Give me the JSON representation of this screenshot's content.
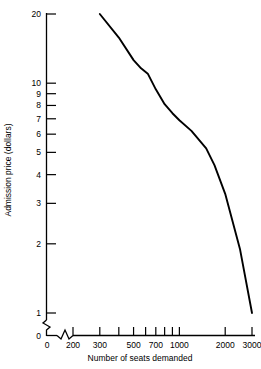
{
  "chart_data": {
    "type": "line",
    "title": "",
    "xlabel": "Number of seats demanded",
    "ylabel": "Admission price (dollars)",
    "x_scale": "log",
    "y_scale": "log",
    "xlim": [
      200,
      3000
    ],
    "ylim": [
      1,
      20
    ],
    "grid": false,
    "legend": null,
    "axis_break": {
      "x": true,
      "y": true,
      "note": "zigzag break between 0 and first log tick on both axes"
    },
    "x_origin_label": "0",
    "y_origin_label": "0",
    "xticks": [
      200,
      300,
      400,
      500,
      600,
      700,
      800,
      900,
      1000,
      2000,
      3000
    ],
    "xticklabels": [
      "200",
      "300",
      "",
      "500",
      "",
      "700",
      "",
      "",
      "1000",
      "2000",
      "3000"
    ],
    "yticks": [
      1,
      2,
      3,
      4,
      5,
      6,
      7,
      8,
      9,
      10,
      20
    ],
    "yticklabels": [
      "1",
      "2",
      "3",
      "4",
      "5",
      "6",
      "7",
      "8",
      "9",
      "10",
      "20"
    ],
    "series": [
      {
        "name": "Demand curve",
        "color": "#000000",
        "x": [
          300,
          400,
          500,
          560,
          620,
          700,
          800,
          900,
          1000,
          1200,
          1500,
          1700,
          2000,
          2500,
          3000
        ],
        "y": [
          20.0,
          15.8,
          12.6,
          11.6,
          11.0,
          9.4,
          8.1,
          7.4,
          6.9,
          6.2,
          5.2,
          4.4,
          3.3,
          1.9,
          1.0
        ]
      }
    ]
  },
  "labels": {
    "xlabel": "Number of seats demanded",
    "ylabel": "Admission price (dollars)"
  }
}
